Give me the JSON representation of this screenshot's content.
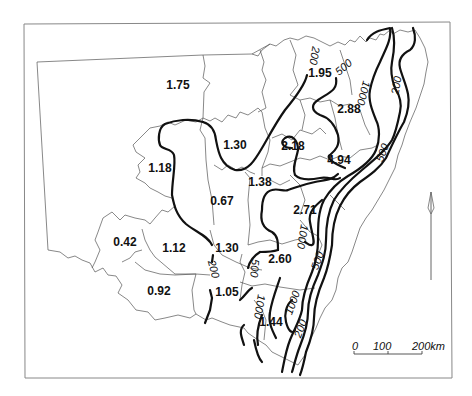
{
  "map": {
    "region_values": [
      {
        "label": "1.75",
        "x": 178,
        "y": 89
      },
      {
        "label": "1.95",
        "x": 312,
        "y": 77
      },
      {
        "label": "2.88",
        "x": 339,
        "y": 111
      },
      {
        "label": "1.30",
        "x": 232,
        "y": 148
      },
      {
        "label": "2.18",
        "x": 295,
        "y": 149
      },
      {
        "label": "4.94",
        "x": 354,
        "y": 164
      },
      {
        "label": "1.18",
        "x": 158,
        "y": 171
      },
      {
        "label": "1.38",
        "x": 254,
        "y": 186
      },
      {
        "label": "0.67",
        "x": 223,
        "y": 203
      },
      {
        "label": "2.71",
        "x": 313,
        "y": 214
      },
      {
        "label": "0.42",
        "x": 125,
        "y": 245
      },
      {
        "label": "1.12",
        "x": 173,
        "y": 251
      },
      {
        "label": "1.30",
        "x": 227,
        "y": 251
      },
      {
        "label": "2.60",
        "x": 277,
        "y": 262
      },
      {
        "label": "0.92",
        "x": 159,
        "y": 294
      },
      {
        "label": "1.05",
        "x": 222,
        "y": 296
      },
      {
        "label": "1.44",
        "x": 272,
        "y": 326
      }
    ],
    "contour_labels": [
      {
        "label": "200",
        "x": 311,
        "y": 55,
        "rot": 100
      },
      {
        "label": "500",
        "x": 340,
        "y": 70,
        "rot": -40
      },
      {
        "label": "1000",
        "x": 365,
        "y": 95,
        "rot": 105
      },
      {
        "label": "200",
        "x": 400,
        "y": 92,
        "rot": -80
      },
      {
        "label": "500",
        "x": 383,
        "y": 155,
        "rot": -70
      },
      {
        "label": "1000",
        "x": 304,
        "y": 238,
        "rot": 100
      },
      {
        "label": "500",
        "x": 253,
        "y": 266,
        "rot": 95
      },
      {
        "label": "500",
        "x": 321,
        "y": 264,
        "rot": -70
      },
      {
        "label": "200",
        "x": 213,
        "y": 267,
        "rot": 75
      },
      {
        "label": "1000",
        "x": 259,
        "y": 304,
        "rot": 100
      },
      {
        "label": "1000",
        "x": 294,
        "y": 306,
        "rot": -70
      },
      {
        "label": "200",
        "x": 303,
        "y": 329,
        "rot": -70
      }
    ],
    "scale_bar": {
      "tick_labels": [
        "0",
        "100",
        "200km"
      ]
    }
  }
}
